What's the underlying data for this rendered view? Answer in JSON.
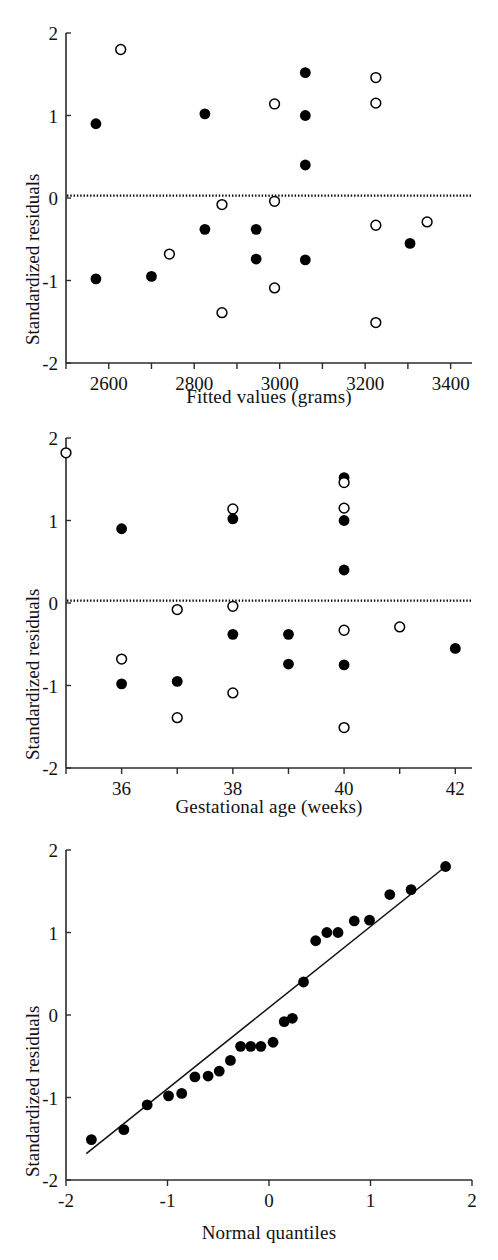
{
  "figure": {
    "ylabel": "Standardized residuals",
    "panels": [
      "fitted",
      "gestational",
      "qq"
    ]
  },
  "chart_data": [
    {
      "id": "fitted",
      "type": "scatter",
      "title": "",
      "xlabel": "Fitted values (grams)",
      "ylabel": "Standardized residuals",
      "xlim": [
        2500,
        3450
      ],
      "ylim": [
        -2,
        2
      ],
      "xticks": [
        2500,
        2600,
        2700,
        2800,
        2900,
        3000,
        3100,
        3200,
        3300,
        3400
      ],
      "xtick_labels": [
        "",
        "2600",
        "",
        "2800",
        "",
        "3000",
        "",
        "3200",
        "",
        "3400"
      ],
      "yticks": [
        -2,
        -1,
        0,
        1,
        2
      ],
      "ytick_labels": [
        "-2",
        "-1",
        "0",
        "1",
        "2"
      ],
      "grid": false,
      "legend": "none",
      "reference_line": {
        "type": "horizontal",
        "y": 0.03,
        "style": "dotted"
      },
      "series": [
        {
          "name": "filled",
          "marker": "filled-circle",
          "color": "#000000",
          "points": [
            [
              2570,
              0.9
            ],
            [
              2570,
              -0.98
            ],
            [
              2700,
              -0.95
            ],
            [
              2825,
              1.02
            ],
            [
              2825,
              -0.38
            ],
            [
              2945,
              -0.38
            ],
            [
              2945,
              -0.74
            ],
            [
              3060,
              1.52
            ],
            [
              3060,
              1.0
            ],
            [
              3060,
              0.4
            ],
            [
              3060,
              -0.75
            ],
            [
              3305,
              -0.55
            ]
          ]
        },
        {
          "name": "open",
          "marker": "open-circle",
          "color": "#000000",
          "points": [
            [
              2628,
              1.8
            ],
            [
              2742,
              -0.68
            ],
            [
              2865,
              -0.08
            ],
            [
              2865,
              -1.39
            ],
            [
              2988,
              1.14
            ],
            [
              2988,
              -0.04
            ],
            [
              2988,
              -1.09
            ],
            [
              3225,
              1.46
            ],
            [
              3225,
              1.15
            ],
            [
              3225,
              -0.33
            ],
            [
              3225,
              -1.51
            ],
            [
              3345,
              -0.29
            ]
          ]
        }
      ]
    },
    {
      "id": "gestational",
      "type": "scatter",
      "title": "",
      "xlabel": "Gestational age (weeks)",
      "ylabel": "Standardized residuals",
      "xlim": [
        35,
        42.3
      ],
      "ylim": [
        -2,
        2
      ],
      "xticks": [
        35,
        36,
        37,
        38,
        39,
        40,
        41,
        42
      ],
      "xtick_labels": [
        "",
        "36",
        "",
        "38",
        "",
        "40",
        "",
        "42"
      ],
      "yticks": [
        -2,
        -1,
        0,
        1,
        2
      ],
      "ytick_labels": [
        "-2",
        "-1",
        "0",
        "1",
        "2"
      ],
      "grid": false,
      "legend": "none",
      "reference_line": {
        "type": "horizontal",
        "y": 0.03,
        "style": "dotted"
      },
      "series": [
        {
          "name": "filled",
          "marker": "filled-circle",
          "color": "#000000",
          "points": [
            [
              36,
              0.9
            ],
            [
              36,
              -0.98
            ],
            [
              37,
              -0.95
            ],
            [
              38,
              1.02
            ],
            [
              38,
              -0.38
            ],
            [
              39,
              -0.38
            ],
            [
              39,
              -0.74
            ],
            [
              40,
              1.52
            ],
            [
              40,
              1.0
            ],
            [
              40,
              0.4
            ],
            [
              40,
              -0.75
            ],
            [
              42,
              -0.55
            ]
          ]
        },
        {
          "name": "open",
          "marker": "open-circle",
          "color": "#000000",
          "points": [
            [
              35,
              1.82
            ],
            [
              36,
              -0.68
            ],
            [
              37,
              -0.08
            ],
            [
              37,
              -1.39
            ],
            [
              38,
              1.14
            ],
            [
              38,
              -0.04
            ],
            [
              38,
              -1.09
            ],
            [
              40,
              1.46
            ],
            [
              40,
              1.15
            ],
            [
              40,
              -0.33
            ],
            [
              40,
              -1.51
            ],
            [
              41,
              -0.29
            ]
          ]
        }
      ]
    },
    {
      "id": "qq",
      "type": "scatter",
      "title": "",
      "xlabel": "Normal quantiles",
      "ylabel": "Standardized residuals",
      "xlim": [
        -2,
        2
      ],
      "ylim": [
        -2,
        2
      ],
      "xticks": [
        -2,
        -1,
        0,
        1,
        2
      ],
      "xtick_labels": [
        "-2",
        "-1",
        "0",
        "1",
        "2"
      ],
      "yticks": [
        -2,
        -1,
        0,
        1,
        2
      ],
      "ytick_labels": [
        "-2",
        "-1",
        "0",
        "1",
        "2"
      ],
      "grid": false,
      "legend": "none",
      "reference_line": {
        "type": "linear",
        "x0": -1.8,
        "y0": -1.68,
        "x1": 1.74,
        "y1": 1.8,
        "style": "solid"
      },
      "series": [
        {
          "name": "residuals",
          "marker": "filled-circle",
          "color": "#000000",
          "points": [
            [
              -1.75,
              -1.51
            ],
            [
              -1.43,
              -1.39
            ],
            [
              -1.2,
              -1.09
            ],
            [
              -0.99,
              -0.98
            ],
            [
              -0.86,
              -0.95
            ],
            [
              -0.73,
              -0.75
            ],
            [
              -0.6,
              -0.74
            ],
            [
              -0.49,
              -0.68
            ],
            [
              -0.38,
              -0.55
            ],
            [
              -0.28,
              -0.38
            ],
            [
              -0.18,
              -0.38
            ],
            [
              -0.08,
              -0.38
            ],
            [
              0.04,
              -0.33
            ],
            [
              0.15,
              -0.08
            ],
            [
              0.23,
              -0.04
            ],
            [
              0.34,
              0.4
            ],
            [
              0.46,
              0.9
            ],
            [
              0.57,
              1.0
            ],
            [
              0.68,
              1.0
            ],
            [
              0.84,
              1.14
            ],
            [
              0.99,
              1.15
            ],
            [
              1.19,
              1.46
            ],
            [
              1.4,
              1.52
            ],
            [
              1.74,
              1.8
            ]
          ]
        }
      ]
    }
  ]
}
